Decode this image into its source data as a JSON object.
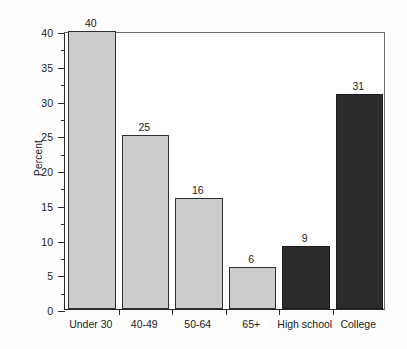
{
  "chart_data": {
    "type": "bar",
    "title": "",
    "subtitle": "",
    "xlabel": "",
    "ylabel": "Percent",
    "ylim": [
      0,
      40
    ],
    "ytick_step": 5,
    "yticks": [
      "0",
      "5",
      "10",
      "15",
      "20",
      "25",
      "30",
      "35",
      "40"
    ],
    "minor_tick_step": 2.5,
    "grid": false,
    "legend": null,
    "categories": [
      "Under 30",
      "40-49",
      "50-64",
      "65+",
      "High school",
      "College"
    ],
    "values": [
      40,
      25,
      16,
      6,
      9,
      31
    ],
    "value_labels": [
      "40",
      "25",
      "16",
      "6",
      "9",
      "31"
    ],
    "bar_colors": [
      "#cccccc",
      "#cccccc",
      "#cccccc",
      "#cccccc",
      "#2b2b2b",
      "#2b2b2b"
    ],
    "groups": [
      {
        "name": "age",
        "color": "#cccccc",
        "categories": [
          "Under 30",
          "40-49",
          "50-64",
          "65+"
        ]
      },
      {
        "name": "education",
        "color": "#2b2b2b",
        "categories": [
          "High school",
          "College"
        ]
      }
    ]
  },
  "style": {
    "light_bar_color": "#cccccc",
    "dark_bar_color": "#2b2b2b",
    "axis_color": "#2a2a2a",
    "frame_color": "#6f6f6f",
    "text_color": "#1a1a1a",
    "background": "#fdfdfd"
  }
}
